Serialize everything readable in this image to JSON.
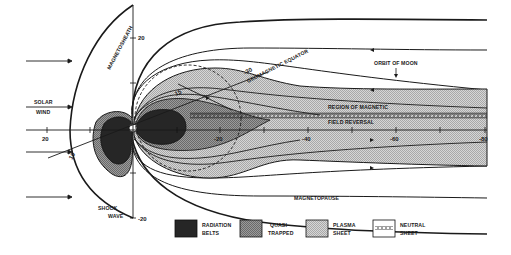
{
  "diagram": {
    "type": "magnetosphere cross-section",
    "labels": {
      "magnetosheath": "MAGNETOSHEATH",
      "solar_wind_line1": "SOLAR",
      "solar_wind_line2": "WIND",
      "shock_wave_line1": "SHOCK",
      "shock_wave_line2": "WAVE",
      "magnetopause": "MAGNETOPAUSE",
      "orbit_of_moon": "ORBIT OF MOON",
      "geomagnetic_equator": "GEOMAGNETIC EQUATOR",
      "region_line1": "REGION OF MAGNETIC",
      "region_line2": "FIELD REVERSAL"
    },
    "axis": {
      "y_top": "20",
      "y_bottom": "-20",
      "x_sun": "20",
      "x_ticks": [
        "-20",
        "-40",
        "-60",
        "-80"
      ],
      "tilted_top": "-30",
      "tilted_mid": "15",
      "tilted_low": "10"
    },
    "legend": [
      {
        "label_line1": "RADIATION",
        "label_line2": "BELTS",
        "swatch": "dark"
      },
      {
        "label_line1": "QUASI-",
        "label_line2": "TRAPPED",
        "swatch": "medium"
      },
      {
        "label_line1": "PLASMA",
        "label_line2": "SHEET",
        "swatch": "light"
      },
      {
        "label_line1": "NEUTRAL",
        "label_line2": "SHEET",
        "swatch": "neutral"
      }
    ],
    "colors": {
      "ink": "#1a1a1a",
      "radiation": "#2a2a2a",
      "quasi": "#8a8a8a",
      "plasma": "#c4c4c4",
      "background": "#ffffff"
    }
  }
}
